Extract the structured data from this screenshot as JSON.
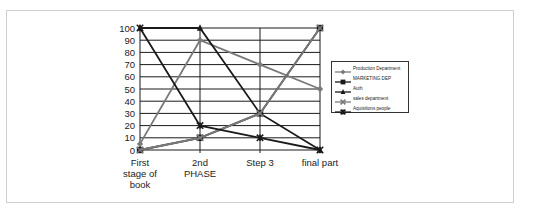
{
  "chart_data": {
    "type": "line",
    "title": "",
    "xlabel": "",
    "ylabel": "",
    "categories": [
      "First stage of book",
      "2nd PHASE",
      "Step 3",
      "final part"
    ],
    "category_lines": [
      [
        "First",
        "stage of",
        "book"
      ],
      [
        "2nd",
        "PHASE"
      ],
      [
        "Step 3"
      ],
      [
        "final part"
      ]
    ],
    "ylim": [
      0,
      100
    ],
    "yticks": [
      "0",
      "10",
      "20",
      "30",
      "40",
      "50",
      "60",
      "70",
      "80",
      "90",
      "100"
    ],
    "grid": true,
    "legend_position": "right",
    "series": [
      {
        "name": "Production Department",
        "values": [
          5,
          90,
          70,
          50
        ],
        "color": "#7a7a7a",
        "marker": "diamond"
      },
      {
        "name": "MARKETING DEP",
        "values": [
          0,
          10,
          30,
          100
        ],
        "color": "#1a1a1a",
        "marker": "square"
      },
      {
        "name": "Auth",
        "values": [
          100,
          100,
          30,
          0
        ],
        "color": "#1a1a1a",
        "marker": "triangle"
      },
      {
        "name": "sales department",
        "values": [
          0,
          10,
          30,
          100
        ],
        "color": "#7a7a7a",
        "marker": "x"
      },
      {
        "name": "Aquisitions people",
        "values": [
          100,
          20,
          10,
          0
        ],
        "color": "#1a1a1a",
        "marker": "star"
      }
    ]
  }
}
